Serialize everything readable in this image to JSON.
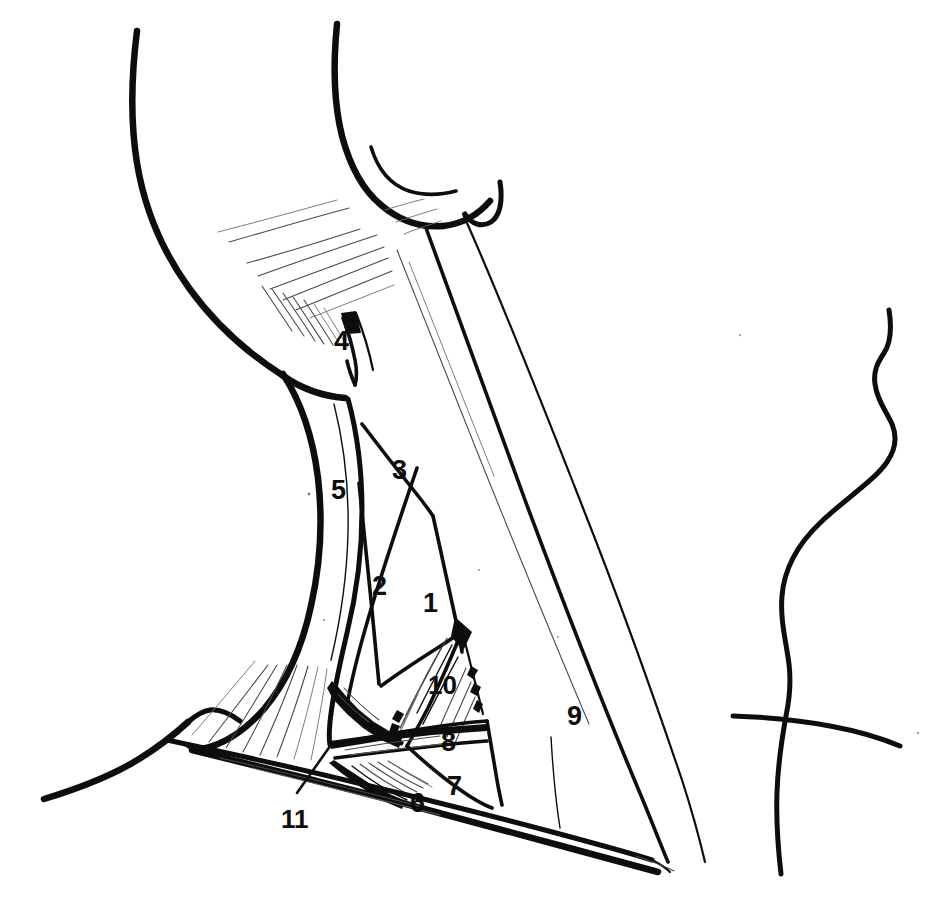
{
  "figure": {
    "background_color": "#ffffff",
    "ink_color": "#0d0d0d",
    "width": 939,
    "height": 916
  },
  "labels": [
    {
      "id": "1",
      "text": "1",
      "x": 423,
      "y": 590,
      "name": "label-1-levator-scapulae"
    },
    {
      "id": "2",
      "text": "2",
      "x": 372,
      "y": 573,
      "name": "label-2-splenius-capitis"
    },
    {
      "id": "3",
      "text": "3",
      "x": 392,
      "y": 457,
      "name": "label-3-scalene"
    },
    {
      "id": "4",
      "text": "4",
      "x": 334,
      "y": 328,
      "name": "label-4-sternocleidomastoid-insertion"
    },
    {
      "id": "5",
      "text": "5",
      "x": 331,
      "y": 477,
      "name": "label-5-sternocleidomastoid"
    },
    {
      "id": "6",
      "text": "6",
      "x": 410,
      "y": 790,
      "name": "label-6-clavicle"
    },
    {
      "id": "7",
      "text": "7",
      "x": 447,
      "y": 773,
      "name": "label-7-subclavius-region"
    },
    {
      "id": "8",
      "text": "8",
      "x": 441,
      "y": 729,
      "name": "label-8-omohyoid-inferior-belly"
    },
    {
      "id": "9",
      "text": "9",
      "x": 567,
      "y": 703,
      "name": "label-9-trapezius"
    },
    {
      "id": "10",
      "text": "10",
      "x": 428,
      "y": 672,
      "name": "label-10-brachial-plexus-region"
    },
    {
      "id": "11",
      "text": "11",
      "x": 281,
      "y": 806,
      "name": "label-11-clavicular-attachment"
    }
  ],
  "leaders": [
    {
      "for": "11",
      "from_x": 297,
      "from_y": 793,
      "to_x": 333,
      "to_y": 742,
      "name": "leader-line-11"
    }
  ],
  "regions": [
    {
      "name": "mandible-jaw-outline"
    },
    {
      "name": "ear-outline"
    },
    {
      "name": "sternocleidomastoid-muscle"
    },
    {
      "name": "trapezius-muscle"
    },
    {
      "name": "posterior-triangle"
    },
    {
      "name": "clavicle-outline"
    },
    {
      "name": "shoulder-contour"
    },
    {
      "name": "chest-profile-right"
    }
  ]
}
